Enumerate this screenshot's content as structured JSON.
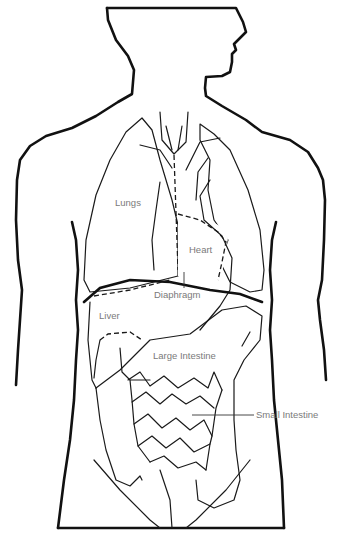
{
  "diagram": {
    "labels": {
      "lungs": "Lungs",
      "heart": "Heart",
      "diaphragm": "Diaphragm",
      "liver": "Liver",
      "large_intestine": "Large Intestine",
      "small_intestine": "Small Intestine"
    },
    "colors": {
      "lung_fill": "#e4e4e4",
      "outline": "#111111",
      "label_text": "#7a7a7a",
      "background": "#ffffff"
    }
  }
}
